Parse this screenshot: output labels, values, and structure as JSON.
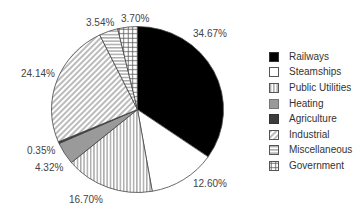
{
  "chart_data": {
    "type": "pie",
    "title": "",
    "start_angle_deg": 0,
    "direction": "clockwise",
    "slices": [
      {
        "label": "Railways",
        "value": 34.67,
        "display": "34.67%",
        "fill": "solid",
        "color": "#000000"
      },
      {
        "label": "Steamships",
        "value": 12.6,
        "display": "12.60%",
        "fill": "solid",
        "color": "#ffffff"
      },
      {
        "label": "Public Utilities",
        "value": 16.7,
        "display": "16.70%",
        "fill": "vertical-lines",
        "color": "#555555"
      },
      {
        "label": "Heating",
        "value": 4.32,
        "display": "4.32%",
        "fill": "solid",
        "color": "#9a9a9a"
      },
      {
        "label": "Agriculture",
        "value": 0.35,
        "display": "0.35%",
        "fill": "solid",
        "color": "#3c3c3c"
      },
      {
        "label": "Industrial",
        "value": 24.14,
        "display": "24.14%",
        "fill": "diagonal-lines",
        "color": "#555555"
      },
      {
        "label": "Miscellaneous",
        "value": 3.54,
        "display": "3.54%",
        "fill": "horizontal-lines",
        "color": "#555555"
      },
      {
        "label": "Government",
        "value": 3.7,
        "display": "3.70%",
        "fill": "grid",
        "color": "#555555"
      }
    ],
    "legend_position": "right"
  },
  "labels": [
    {
      "text": "34.67%",
      "x": 193,
      "y": 29
    },
    {
      "text": "12.60%",
      "x": 193,
      "y": 179
    },
    {
      "text": "16.70%",
      "x": 69,
      "y": 195
    },
    {
      "text": "4.32%",
      "x": 35,
      "y": 163
    },
    {
      "text": "0.35%",
      "x": 27,
      "y": 146
    },
    {
      "text": "24.14%",
      "x": 21,
      "y": 69
    },
    {
      "text": "3.54%",
      "x": 86,
      "y": 18
    },
    {
      "text": "3.70%",
      "x": 121,
      "y": 14
    }
  ],
  "legend": {
    "items": [
      {
        "label": "Railways"
      },
      {
        "label": "Steamships"
      },
      {
        "label": "Public Utilities"
      },
      {
        "label": "Heating"
      },
      {
        "label": "Agriculture"
      },
      {
        "label": "Industrial"
      },
      {
        "label": "Miscellaneous"
      },
      {
        "label": "Government"
      }
    ]
  }
}
